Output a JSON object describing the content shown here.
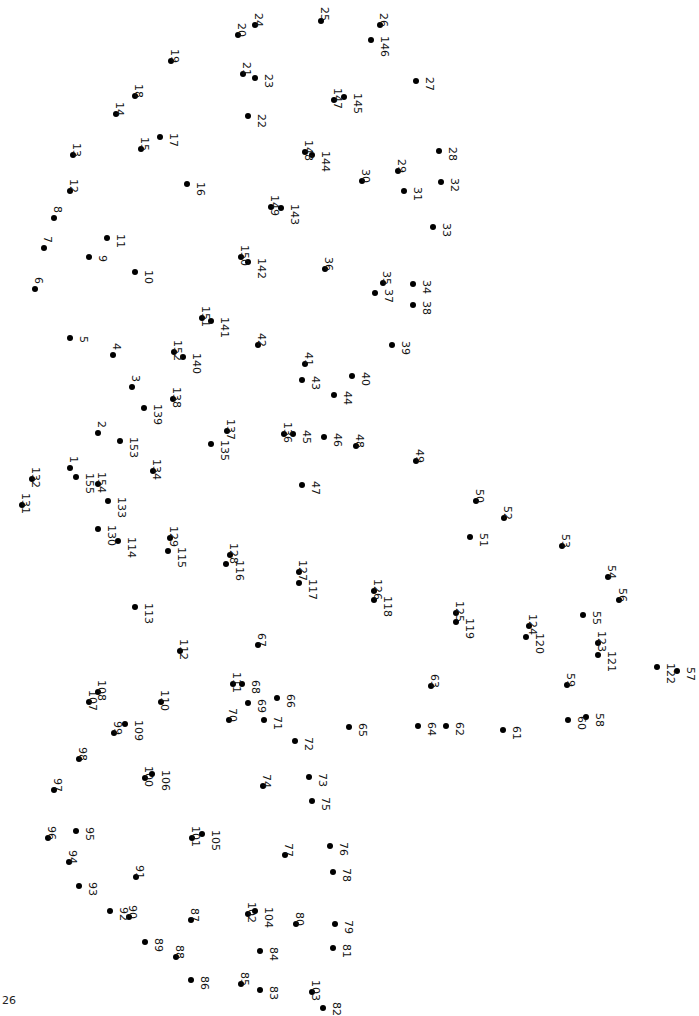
{
  "page": {
    "page_number": "26",
    "background": "#ffffff",
    "dot_color": "#000000"
  },
  "puzzle": {
    "type": "connect-the-dots",
    "label_orientation": "rotated-90",
    "dots": [
      [
        1,
        70,
        468,
        -2,
        -12
      ],
      [
        2,
        98,
        433,
        -2,
        -12
      ],
      [
        3,
        132,
        387,
        -2,
        -12
      ],
      [
        4,
        113,
        355,
        -2,
        -12
      ],
      [
        5,
        70,
        338,
        8,
        -2
      ],
      [
        6,
        35,
        289,
        -2,
        -12
      ],
      [
        7,
        44,
        248,
        -2,
        -12
      ],
      [
        8,
        54,
        218,
        -2,
        -12
      ],
      [
        9,
        89,
        257,
        8,
        -2
      ],
      [
        10,
        135,
        272,
        8,
        -2
      ],
      [
        11,
        107,
        238,
        8,
        -4
      ],
      [
        12,
        70,
        191,
        -2,
        -12
      ],
      [
        13,
        73,
        155,
        -2,
        -12
      ],
      [
        14,
        116,
        114,
        -2,
        -12
      ],
      [
        15,
        141,
        149,
        -2,
        -12
      ],
      [
        16,
        187,
        184,
        8,
        -2
      ],
      [
        17,
        160,
        137,
        8,
        -4
      ],
      [
        18,
        135,
        96,
        -2,
        -12
      ],
      [
        19,
        171,
        61,
        -2,
        -12
      ],
      [
        20,
        238,
        35,
        -2,
        -12
      ],
      [
        21,
        243,
        74,
        -2,
        -12
      ],
      [
        22,
        248,
        116,
        8,
        -2
      ],
      [
        23,
        255,
        78,
        8,
        -4
      ],
      [
        24,
        255,
        25,
        -2,
        -12
      ],
      [
        25,
        321,
        21,
        -2,
        -14
      ],
      [
        26,
        380,
        25,
        -2,
        -12
      ],
      [
        27,
        416,
        81,
        8,
        -4
      ],
      [
        28,
        439,
        151,
        8,
        -4
      ],
      [
        29,
        398,
        171,
        -2,
        -12
      ],
      [
        30,
        362,
        181,
        -2,
        -12
      ],
      [
        31,
        404,
        191,
        8,
        -4
      ],
      [
        32,
        441,
        182,
        8,
        -4
      ],
      [
        33,
        433,
        227,
        8,
        -4
      ],
      [
        34,
        413,
        284,
        8,
        -4
      ],
      [
        35,
        383,
        283,
        -2,
        -12
      ],
      [
        36,
        325,
        269,
        -2,
        -12
      ],
      [
        37,
        375,
        293,
        8,
        -4
      ],
      [
        38,
        413,
        305,
        8,
        -4
      ],
      [
        39,
        392,
        345,
        8,
        -4
      ],
      [
        40,
        352,
        376,
        8,
        -4
      ],
      [
        41,
        305,
        364,
        -2,
        -12
      ],
      [
        42,
        258,
        345,
        -2,
        -12
      ],
      [
        43,
        302,
        380,
        8,
        -4
      ],
      [
        44,
        334,
        395,
        8,
        -4
      ],
      [
        45,
        293,
        434,
        8,
        -4
      ],
      [
        46,
        324,
        437,
        8,
        -4
      ],
      [
        47,
        302,
        485,
        8,
        -4
      ],
      [
        48,
        356,
        446,
        -2,
        -12
      ],
      [
        49,
        416,
        461,
        -2,
        -12
      ],
      [
        50,
        476,
        501,
        -2,
        -12
      ],
      [
        51,
        470,
        537,
        8,
        -4
      ],
      [
        52,
        504,
        518,
        -2,
        -12
      ],
      [
        53,
        562,
        546,
        -2,
        -12
      ],
      [
        54,
        608,
        577,
        -2,
        -12
      ],
      [
        55,
        583,
        615,
        8,
        -4
      ],
      [
        56,
        619,
        600,
        -2,
        -12
      ],
      [
        57,
        677,
        671,
        8,
        -4
      ],
      [
        58,
        586,
        717,
        8,
        -4
      ],
      [
        59,
        567,
        685,
        -2,
        -12
      ],
      [
        60,
        568,
        720,
        8,
        -4
      ],
      [
        61,
        503,
        730,
        8,
        -4
      ],
      [
        62,
        446,
        726,
        8,
        -4
      ],
      [
        63,
        431,
        686,
        -2,
        -12
      ],
      [
        64,
        418,
        726,
        8,
        -4
      ],
      [
        65,
        349,
        727,
        8,
        -4
      ],
      [
        66,
        277,
        698,
        8,
        -4
      ],
      [
        67,
        258,
        645,
        -2,
        -12
      ],
      [
        68,
        242,
        684,
        8,
        -4
      ],
      [
        69,
        248,
        703,
        8,
        -4
      ],
      [
        70,
        229,
        720,
        -2,
        -12
      ],
      [
        71,
        264,
        720,
        8,
        -4
      ],
      [
        72,
        295,
        741,
        8,
        -4
      ],
      [
        73,
        309,
        777,
        8,
        -4
      ],
      [
        74,
        263,
        786,
        -2,
        -12
      ],
      [
        75,
        312,
        801,
        8,
        -4
      ],
      [
        76,
        330,
        846,
        8,
        -4
      ],
      [
        77,
        285,
        855,
        -2,
        -12
      ],
      [
        78,
        333,
        872,
        8,
        -4
      ],
      [
        79,
        335,
        924,
        8,
        -4
      ],
      [
        80,
        296,
        924,
        -2,
        -12
      ],
      [
        81,
        333,
        948,
        8,
        -4
      ],
      [
        82,
        323,
        1008,
        8,
        -6
      ],
      [
        83,
        260,
        990,
        8,
        -4
      ],
      [
        84,
        260,
        951,
        8,
        -4
      ],
      [
        85,
        241,
        984,
        -2,
        -12
      ],
      [
        86,
        191,
        980,
        8,
        -4
      ],
      [
        87,
        191,
        920,
        -2,
        -12
      ],
      [
        88,
        176,
        957,
        -2,
        -12
      ],
      [
        89,
        145,
        942,
        8,
        -4
      ],
      [
        90,
        129,
        917,
        -2,
        -12
      ],
      [
        91,
        136,
        877,
        -2,
        -12
      ],
      [
        92,
        110,
        911,
        8,
        -4
      ],
      [
        93,
        79,
        886,
        8,
        -4
      ],
      [
        94,
        69,
        862,
        -2,
        -12
      ],
      [
        95,
        76,
        831,
        8,
        -4
      ],
      [
        96,
        48,
        838,
        -2,
        -12
      ],
      [
        97,
        54,
        790,
        -2,
        -12
      ],
      [
        98,
        79,
        759,
        -2,
        -12
      ],
      [
        99,
        114,
        733,
        -2,
        -12
      ],
      [
        100,
        145,
        778,
        -2,
        -12
      ],
      [
        101,
        192,
        838,
        -2,
        -12
      ],
      [
        102,
        248,
        914,
        -2,
        -12
      ],
      [
        103,
        312,
        992,
        -2,
        -12
      ],
      [
        104,
        255,
        911,
        8,
        -4
      ],
      [
        105,
        202,
        834,
        8,
        -4
      ],
      [
        106,
        152,
        774,
        8,
        -4
      ],
      [
        107,
        89,
        702,
        -2,
        -12
      ],
      [
        108,
        98,
        692,
        -2,
        -12
      ],
      [
        109,
        125,
        724,
        8,
        -4
      ],
      [
        110,
        161,
        702,
        -2,
        -12
      ],
      [
        111,
        233,
        684,
        -2,
        -12
      ],
      [
        112,
        180,
        651,
        -2,
        -12
      ],
      [
        113,
        135,
        607,
        8,
        -4
      ],
      [
        114,
        118,
        541,
        8,
        -4
      ],
      [
        115,
        168,
        551,
        8,
        -4
      ],
      [
        116,
        226,
        564,
        8,
        -4
      ],
      [
        117,
        299,
        583,
        8,
        -4
      ],
      [
        118,
        374,
        600,
        8,
        -4
      ],
      [
        119,
        456,
        622,
        8,
        -4
      ],
      [
        120,
        526,
        637,
        8,
        -4
      ],
      [
        121,
        598,
        655,
        8,
        -4
      ],
      [
        122,
        657,
        667,
        8,
        -4
      ],
      [
        123,
        598,
        643,
        -2,
        -12
      ],
      [
        124,
        529,
        626,
        -2,
        -12
      ],
      [
        125,
        456,
        613,
        -2,
        -12
      ],
      [
        126,
        374,
        591,
        -2,
        -12
      ],
      [
        127,
        299,
        572,
        -2,
        -12
      ],
      [
        128,
        230,
        555,
        -2,
        -12
      ],
      [
        129,
        170,
        538,
        -2,
        -12
      ],
      [
        130,
        98,
        529,
        8,
        -4
      ],
      [
        131,
        22,
        505,
        -2,
        -12
      ],
      [
        132,
        32,
        479,
        -2,
        -12
      ],
      [
        133,
        108,
        501,
        8,
        -4
      ],
      [
        134,
        153,
        471,
        -2,
        -12
      ],
      [
        135,
        211,
        444,
        8,
        -4
      ],
      [
        136,
        284,
        434,
        -2,
        -12
      ],
      [
        137,
        227,
        431,
        -2,
        -12
      ],
      [
        138,
        173,
        399,
        -2,
        -12
      ],
      [
        139,
        144,
        408,
        8,
        -4
      ],
      [
        140,
        183,
        357,
        8,
        -4
      ],
      [
        141,
        211,
        321,
        8,
        -4
      ],
      [
        142,
        248,
        262,
        8,
        -4
      ],
      [
        143,
        281,
        208,
        8,
        -4
      ],
      [
        144,
        312,
        155,
        8,
        -4
      ],
      [
        145,
        344,
        97,
        8,
        -4
      ],
      [
        146,
        371,
        40,
        8,
        -4
      ],
      [
        147,
        334,
        100,
        -2,
        -12
      ],
      [
        148,
        305,
        152,
        -2,
        -12
      ],
      [
        149,
        271,
        207,
        -2,
        -12
      ],
      [
        150,
        241,
        257,
        -2,
        -12
      ],
      [
        151,
        202,
        318,
        -2,
        -12
      ],
      [
        152,
        174,
        352,
        -2,
        -12
      ],
      [
        153,
        120,
        441,
        8,
        -4
      ],
      [
        154,
        98,
        484,
        -2,
        -12
      ],
      [
        155,
        76,
        477,
        8,
        -4
      ]
    ]
  }
}
